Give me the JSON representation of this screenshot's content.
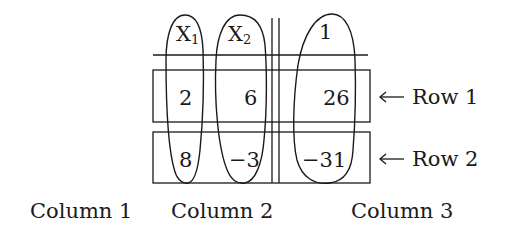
{
  "diagram": {
    "header": {
      "x1": {
        "base": "X",
        "sub": "1"
      },
      "x2": {
        "base": "X",
        "sub": "2"
      },
      "constant": "1"
    },
    "rows": [
      {
        "label": "Row 1",
        "arrow": "←",
        "values": [
          "2",
          "6",
          "26"
        ]
      },
      {
        "label": "Row 2",
        "arrow": "←",
        "values": [
          "8",
          "−3",
          "−31"
        ]
      }
    ],
    "columns": [
      {
        "label": "Column 1"
      },
      {
        "label": "Column 2"
      },
      {
        "label": "Column 3"
      }
    ],
    "colors": {
      "line": "#1a1a1a",
      "background": "#ffffff"
    }
  }
}
